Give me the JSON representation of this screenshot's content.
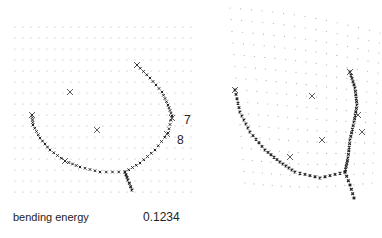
{
  "figure": {
    "left_panel": {
      "landmark_labels": [
        {
          "text": "7",
          "x": 184,
          "y": 113
        },
        {
          "text": "8",
          "x": 177,
          "y": 133
        }
      ],
      "caption_label": "bending energy",
      "caption_value": "0.1234"
    },
    "right_panel": {
      "description": "deformed grid"
    },
    "colors": {
      "grid": "#b0b0b0",
      "curve": "#222222",
      "landmark": "#333333"
    }
  }
}
